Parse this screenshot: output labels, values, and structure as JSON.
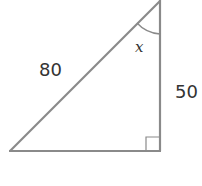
{
  "diagram": {
    "type": "right-triangle",
    "hypotenuse_label": "80",
    "side_label": "50",
    "angle_label": "x",
    "colors": {
      "stroke": "#8a8a8a",
      "text": "#333333",
      "background": "#ffffff"
    }
  }
}
